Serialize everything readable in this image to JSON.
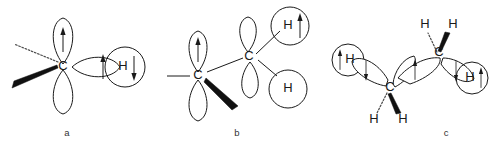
{
  "figure": {
    "background_color": "#ffffff",
    "line_color": "#1a1a1a",
    "wedge_color": "#111111",
    "dash_color": "#4a4a4a"
  },
  "panels": [
    {
      "id": "a",
      "caption": "a",
      "description": "Carbon with hybrid orbitals overlapping a hydrogen 1s orbital",
      "atoms": [
        {
          "label": "C",
          "name": "carbon-center"
        },
        {
          "label": "H",
          "name": "hydrogen-right"
        }
      ],
      "orbitals": [
        {
          "name": "lobe-up",
          "spin": "up",
          "arrow": "↑"
        },
        {
          "name": "lobe-down",
          "spin": "none",
          "arrow": ""
        },
        {
          "name": "lobe-right",
          "spin": "up",
          "arrow": "↑"
        }
      ],
      "hydrogen_spins": [
        {
          "name": "hydrogen-right-spin",
          "spin": "down",
          "arrow": "↓"
        }
      ],
      "bonds": [
        {
          "name": "bond-dashed-upper-left",
          "style": "dashed"
        },
        {
          "name": "bond-wedge-lower-left",
          "style": "wedge"
        }
      ]
    },
    {
      "id": "b",
      "caption": "b",
      "description": "Two carbons joined by a sigma bond with two hydrogen orbitals",
      "atoms": [
        {
          "label": "C",
          "name": "carbon-left"
        },
        {
          "label": "C",
          "name": "carbon-right"
        },
        {
          "label": "H",
          "name": "hydrogen-upper"
        },
        {
          "label": "H",
          "name": "hydrogen-lower"
        }
      ],
      "orbitals": [
        {
          "name": "left-lobe-up",
          "spin": "up",
          "arrow": "↑"
        },
        {
          "name": "left-lobe-down",
          "spin": "none",
          "arrow": ""
        },
        {
          "name": "right-lobe-up",
          "spin": "none",
          "arrow": ""
        },
        {
          "name": "right-lobe-down",
          "spin": "none",
          "arrow": ""
        }
      ],
      "hydrogen_spins": [
        {
          "name": "hydrogen-upper-spin",
          "spin": "up",
          "arrow": "↑"
        },
        {
          "name": "hydrogen-lower-spin",
          "spin": "none",
          "arrow": ""
        }
      ],
      "bonds": [
        {
          "name": "bond-plain-left",
          "style": "line"
        },
        {
          "name": "bond-wedge-left-carbon",
          "style": "wedge"
        },
        {
          "name": "bond-line-carbon-carbon",
          "style": "line"
        },
        {
          "name": "bond-line-to-hydrogen-upper",
          "style": "line"
        },
        {
          "name": "bond-line-to-hydrogen-lower",
          "style": "line"
        }
      ]
    },
    {
      "id": "c",
      "caption": "c",
      "description": "Ethane-like fragment with two carbons, overlapping orbitals and four hydrogens",
      "atoms": [
        {
          "label": "C",
          "name": "carbon-left"
        },
        {
          "label": "C",
          "name": "carbon-right"
        },
        {
          "label": "H",
          "name": "hydrogen-outer-left"
        },
        {
          "label": "H",
          "name": "hydrogen-outer-right"
        },
        {
          "label": "H",
          "name": "hydrogen-bottom-left"
        },
        {
          "label": "H",
          "name": "hydrogen-bottom-right"
        },
        {
          "label": "H",
          "name": "hydrogen-top-left"
        },
        {
          "label": "H",
          "name": "hydrogen-top-right"
        }
      ],
      "orbitals": [
        {
          "name": "left-outer-lobe",
          "spin": "down",
          "arrow": "↓"
        },
        {
          "name": "left-inner-lobe",
          "spin": "none",
          "arrow": ""
        },
        {
          "name": "center-lobe-left",
          "spin": "up",
          "arrow": "↑"
        },
        {
          "name": "center-lobe-right",
          "spin": "none",
          "arrow": ""
        },
        {
          "name": "right-outer-lobe",
          "spin": "down",
          "arrow": "↓"
        }
      ],
      "hydrogen_spins": [
        {
          "name": "hydrogen-outer-left-spin",
          "spin": "up",
          "arrow": "↑"
        },
        {
          "name": "hydrogen-outer-right-spin",
          "spin": "up",
          "arrow": "↑"
        }
      ],
      "bonds": [
        {
          "name": "bond-dashed-left-carbon",
          "style": "dashed"
        },
        {
          "name": "bond-wedge-left-carbon",
          "style": "wedge"
        },
        {
          "name": "bond-dashed-right-carbon",
          "style": "dashed"
        },
        {
          "name": "bond-wedge-right-carbon",
          "style": "wedge"
        }
      ]
    }
  ]
}
